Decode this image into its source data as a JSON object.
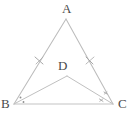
{
  "figure": {
    "type": "geometry-diagram",
    "background_color": "#ffffff",
    "stroke_color": "#b9b9b9",
    "mark_color": "#9a9a9a",
    "label_color": "#4a4a4a"
  },
  "points": {
    "A": {
      "label": "A",
      "x": 66,
      "y": 19,
      "label_x": 62,
      "label_y": 2
    },
    "B": {
      "label": "B",
      "x": 14,
      "y": 104,
      "label_x": 1,
      "label_y": 97
    },
    "C": {
      "label": "C",
      "x": 113,
      "y": 104,
      "label_x": 118,
      "label_y": 97
    },
    "D": {
      "label": "D",
      "x": 67,
      "y": 76,
      "label_x": 58,
      "label_y": 59
    }
  },
  "segments": [
    {
      "name": "AB",
      "from": "A",
      "to": "B",
      "ticks": 1
    },
    {
      "name": "AC",
      "from": "A",
      "to": "C",
      "ticks": 1
    },
    {
      "name": "BC",
      "from": "B",
      "to": "C",
      "ticks": 0
    },
    {
      "name": "BD",
      "from": "B",
      "to": "D",
      "ticks": 0
    },
    {
      "name": "DC",
      "from": "D",
      "to": "C",
      "ticks": 0
    }
  ],
  "angle_marks": [
    {
      "name": "angle-mark-b-upper",
      "vertex": "B",
      "style": "dot"
    },
    {
      "name": "angle-mark-b-lower",
      "vertex": "B",
      "style": "dot"
    },
    {
      "name": "angle-mark-c-upper",
      "vertex": "C",
      "style": "tick"
    },
    {
      "name": "angle-mark-c-lower",
      "vertex": "C",
      "style": "tick"
    }
  ]
}
